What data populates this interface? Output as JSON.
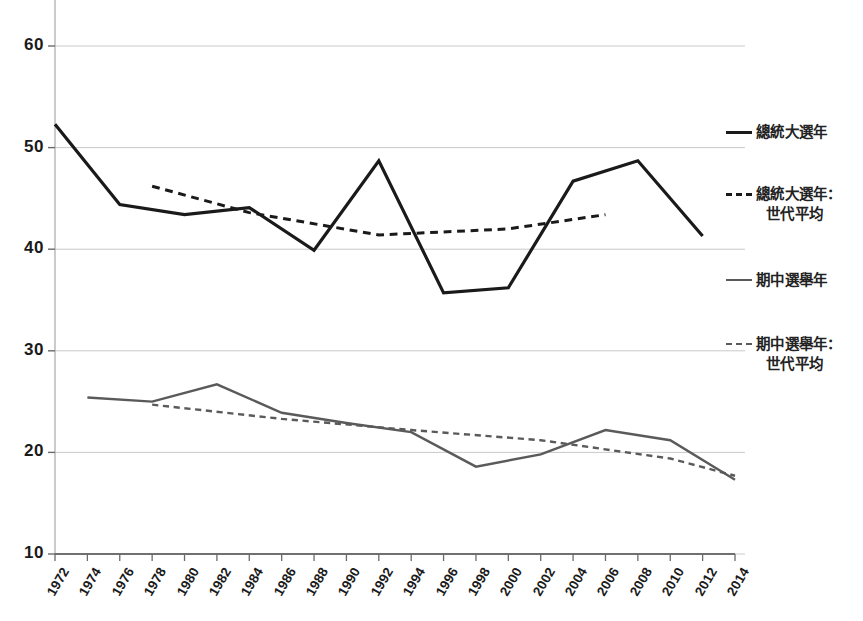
{
  "chart_data": {
    "type": "line",
    "title": "",
    "subtitle": "",
    "xlabel": "",
    "ylabel": "",
    "xlim": [
      1972,
      2014
    ],
    "ylim": [
      10,
      63
    ],
    "grid": "horizontal",
    "legend_position": "right",
    "x": [
      1972,
      1974,
      1976,
      1978,
      1980,
      1982,
      1984,
      1986,
      1988,
      1990,
      1992,
      1994,
      1996,
      1998,
      2000,
      2002,
      2004,
      2006,
      2008,
      2010,
      2012,
      2014
    ],
    "xtick_labels": [
      "1972",
      "1974",
      "1976",
      "1978",
      "1980",
      "1982",
      "1984",
      "1986",
      "1988",
      "1990",
      "1992",
      "1994",
      "1996",
      "1998",
      "2000",
      "2002",
      "2004",
      "2006",
      "2008",
      "2010",
      "2012",
      "2014"
    ],
    "ytick_labels": [
      "60",
      "50",
      "40",
      "30",
      "20",
      "10"
    ],
    "ytick_values": [
      60,
      50,
      40,
      30,
      20,
      10
    ],
    "series": [
      {
        "name": "總統大選年",
        "style": "solid",
        "color": "#1a1a1a",
        "width": 3.2,
        "x": [
          1972,
          1976,
          1980,
          1984,
          1988,
          1992,
          1996,
          2000,
          2004,
          2008,
          2012
        ],
        "values": [
          52.3,
          44.4,
          43.4,
          44.1,
          39.9,
          48.7,
          35.7,
          36.2,
          46.7,
          48.7,
          41.3
        ]
      },
      {
        "name": "總統大選年：世代平均",
        "style": "dashed",
        "color": "#1a1a1a",
        "width": 3.0,
        "x": [
          1978,
          1984,
          1992,
          2000,
          2006
        ],
        "values": [
          46.2,
          43.6,
          41.4,
          42.0,
          43.4
        ]
      },
      {
        "name": "期中選舉年",
        "style": "solid",
        "color": "#5a5a5a",
        "width": 2.4,
        "x": [
          1974,
          1978,
          1982,
          1986,
          1990,
          1994,
          1998,
          2002,
          2006,
          2010,
          2014
        ],
        "values": [
          25.4,
          25.0,
          26.7,
          23.9,
          22.9,
          22.0,
          18.6,
          19.8,
          22.2,
          21.2,
          17.3
        ]
      },
      {
        "name": "期中選舉年：世代平均",
        "style": "dashed",
        "color": "#5a5a5a",
        "width": 2.4,
        "x": [
          1978,
          1986,
          1994,
          2002,
          2010,
          2014
        ],
        "values": [
          24.7,
          23.3,
          22.2,
          21.2,
          19.4,
          17.7
        ]
      }
    ]
  },
  "legend": {
    "entries": [
      {
        "label": "總統大選年",
        "label_line2": "",
        "swatch": "solid-black"
      },
      {
        "label": "總統大選年：",
        "label_line2": "世代平均",
        "swatch": "dash-black"
      },
      {
        "label": "期中選舉年",
        "label_line2": "",
        "swatch": "solid-gray"
      },
      {
        "label": "期中選舉年：",
        "label_line2": "世代平均",
        "swatch": "dash-gray"
      }
    ]
  },
  "axis": {
    "y_min_label": "10",
    "y_max_label": "60"
  }
}
